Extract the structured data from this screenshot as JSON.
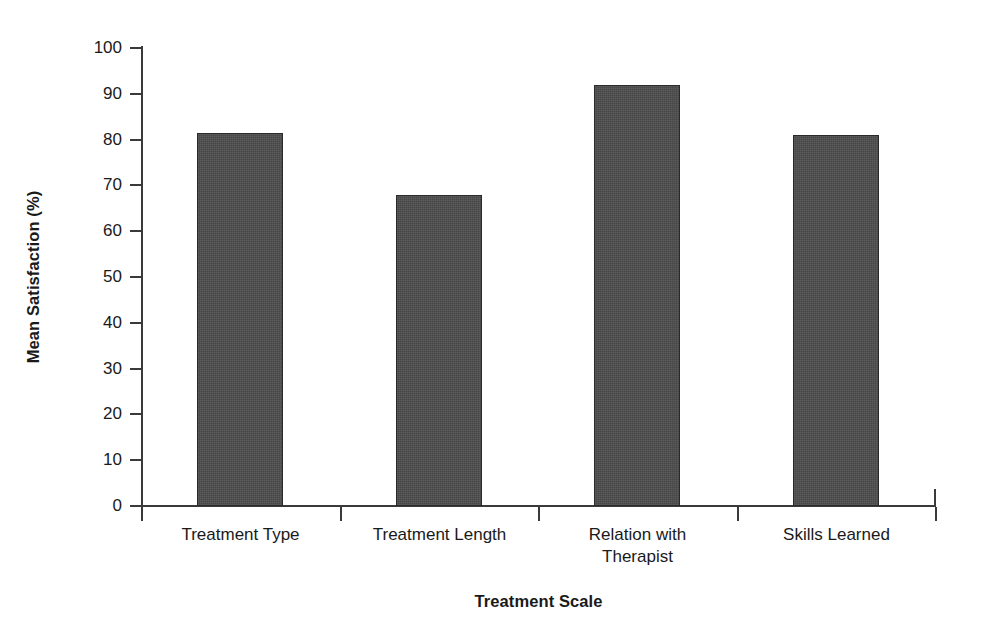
{
  "chart_data": {
    "type": "bar",
    "title": "",
    "subtitle": "",
    "categories": [
      "Treatment Type",
      "Treatment Length",
      "Relation with Therapist",
      "Skills Learned"
    ],
    "category_lines": [
      [
        "Treatment Type"
      ],
      [
        "Treatment Length"
      ],
      [
        "Relation with",
        "Therapist"
      ],
      [
        "Skills Learned"
      ]
    ],
    "values": [
      81.5,
      68,
      92,
      81
    ],
    "xlabel": "Treatment Scale",
    "ylabel": "Mean Satisfaction (%)",
    "ylim": [
      0,
      100
    ],
    "ytick_values": [
      0,
      10,
      20,
      30,
      40,
      50,
      60,
      70,
      80,
      90,
      100
    ],
    "ytick_labels": [
      "0",
      "10",
      "20",
      "30",
      "40",
      "50",
      "60",
      "70",
      "80",
      "90",
      "100"
    ],
    "grid": false,
    "legend": "none",
    "bar_color": "#4d4d4d",
    "bar_edge_color": "#2a2a2a",
    "axis_color": "#3a3a3a",
    "background_color": "#ffffff"
  }
}
